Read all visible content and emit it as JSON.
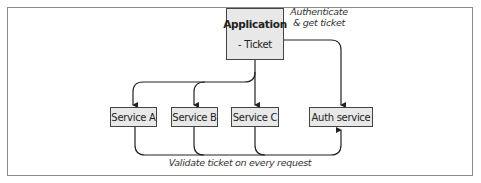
{
  "application": {
    "title": "Application",
    "item": "- Ticket"
  },
  "services": [
    {
      "label": "Service A"
    },
    {
      "label": "Service B"
    },
    {
      "label": "Service C"
    }
  ],
  "auth_service": {
    "label": "Auth service"
  },
  "edges": {
    "authenticate": {
      "line1": "Authenticate",
      "line2": "& get ticket"
    },
    "validate": {
      "label": "Validate ticket on every request"
    }
  },
  "colors": {
    "box_fill": "#e8e8e8",
    "stroke": "#222222",
    "frame": "#8a8a8a"
  }
}
